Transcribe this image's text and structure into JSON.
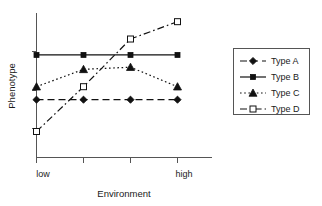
{
  "chart_data": {
    "type": "line",
    "title": "",
    "xlabel": "Environment",
    "ylabel": "Phenotype",
    "x": [
      1,
      2,
      3,
      4
    ],
    "categories": [
      "low",
      "",
      "",
      "high"
    ],
    "xtick_labels": [
      "low",
      "high"
    ],
    "ytick_labels": [],
    "grid": false,
    "legend_position": "right",
    "xlim": [
      0.75,
      4.25
    ],
    "ylim": [
      0,
      10
    ],
    "series": [
      {
        "name": "Type A",
        "values": [
          4.0,
          4.0,
          4.0,
          4.0
        ],
        "line_style": "dashed",
        "marker": "diamond",
        "marker_fill": "filled",
        "color": "#111111"
      },
      {
        "name": "Type B",
        "values": [
          7.1,
          7.1,
          7.1,
          7.1
        ],
        "line_style": "solid",
        "marker": "square",
        "marker_fill": "filled",
        "color": "#111111"
      },
      {
        "name": "Type C",
        "values": [
          4.9,
          6.1,
          6.25,
          4.9
        ],
        "line_style": "dotted",
        "marker": "triangle",
        "marker_fill": "filled",
        "color": "#111111"
      },
      {
        "name": "Type D",
        "values": [
          1.8,
          4.9,
          8.2,
          9.4
        ],
        "line_style": "dashdot",
        "marker": "square",
        "marker_fill": "open",
        "color": "#111111"
      }
    ]
  },
  "legend": {
    "entries": [
      {
        "label": "Type A"
      },
      {
        "label": "Type B"
      },
      {
        "label": "Type C"
      },
      {
        "label": "Type D"
      }
    ]
  },
  "axes": {
    "x_label": "Environment",
    "y_label": "Phenotype",
    "x_low_label": "low",
    "x_high_label": "high"
  },
  "colors": {
    "ink": "#111111",
    "axis": "#555555",
    "background": "#ffffff"
  }
}
